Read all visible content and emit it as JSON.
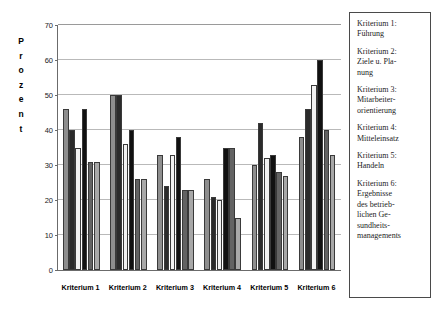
{
  "chart_data": {
    "type": "bar",
    "title": "",
    "xlabel": "",
    "ylabel": "Prozent",
    "ylim": [
      0,
      70
    ],
    "ytick_step": 10,
    "yticks": [
      0,
      10,
      20,
      30,
      40,
      50,
      60,
      70
    ],
    "grid": true,
    "legend_position": "right",
    "categories": [
      "Kriterium 1",
      "Kriterium 2",
      "Kriterium 3",
      "Kriterium 4",
      "Kriterium 5",
      "Kriterium 6"
    ],
    "series": [
      {
        "name": "Kriterium 1: Führung",
        "values": [
          46,
          50,
          33,
          26,
          30,
          38
        ]
      },
      {
        "name": "Kriterium 2: Ziele u. Planung",
        "values": [
          40,
          50,
          24,
          21,
          42,
          46
        ]
      },
      {
        "name": "Kriterium 3: Mitarbeiterorientierung",
        "values": [
          35,
          36,
          33,
          20,
          32,
          53
        ]
      },
      {
        "name": "Kriterium 4: Mitteleinsatz",
        "values": [
          46,
          40,
          38,
          35,
          33,
          60
        ]
      },
      {
        "name": "Kriterium 5: Handeln",
        "values": [
          31,
          26,
          23,
          35,
          28,
          40
        ]
      },
      {
        "name": "Kriterium 6: Ergebnisse des betrieblichen Gesundheitsmanagements",
        "values": [
          31,
          26,
          23,
          15,
          27,
          33
        ]
      }
    ]
  },
  "axis": {
    "y_title_letters": [
      "P",
      "r",
      "o",
      "z",
      "e",
      "n",
      "t"
    ]
  },
  "legend": {
    "entries": [
      "Kriterium 1: Führung",
      "Kriterium 2: Ziele u. Pla-nung",
      "Kriterium 3: Mitarbeiter-orientierung",
      "Kriterium 4: Mitteleinsatz",
      "Kriterium 5: Handeln",
      "Kriterium 6: Ergebnisse des betrieb-lichen Ge-sundheits-managements"
    ],
    "entries_display": [
      [
        "Kriterium 1:",
        "Führung"
      ],
      [
        "Kriterium 2:",
        "Ziele u. Pla-",
        "nung"
      ],
      [
        "Kriterium 3:",
        "Mitarbeiter-",
        "orientierung"
      ],
      [
        "Kriterium 4:",
        "Mitteleinsatz"
      ],
      [
        "Kriterium 5:",
        "Handeln"
      ],
      [
        "Kriterium 6:",
        "Ergebnisse",
        "des betrieb-",
        "lichen Ge-",
        "sundheits-",
        "managements"
      ]
    ]
  },
  "colors": {
    "series": [
      "#8e8e8e",
      "#2b2b2b",
      "#f2f2f2",
      "#111111",
      "#636363",
      "#a8a8a8"
    ],
    "axis": "#6b6b6b",
    "grid": "#b9b9b9",
    "legend_border": "#4a4a4a",
    "background": "#ffffff"
  }
}
